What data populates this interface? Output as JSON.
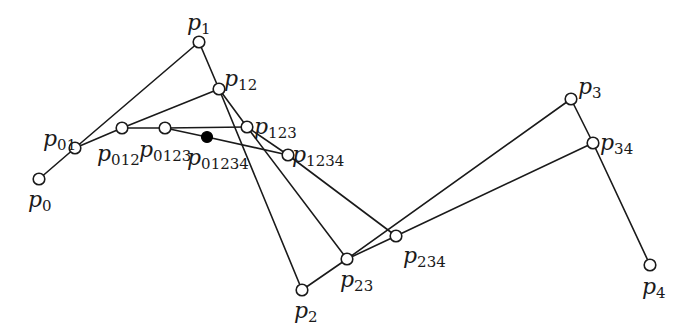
{
  "diagram": {
    "colors": {
      "line": "#1a1a1a",
      "open_point_fill": "#ffffff",
      "result_point_fill": "#000000",
      "background": "#ffffff"
    },
    "points": [
      {
        "id": "p0",
        "base": "p",
        "sub": "0",
        "x": 39,
        "y": 179,
        "filled": false,
        "lx": 28,
        "ly": 207
      },
      {
        "id": "p1",
        "base": "p",
        "sub": "1",
        "x": 199,
        "y": 42,
        "filled": false,
        "lx": 187,
        "ly": 30
      },
      {
        "id": "p2",
        "base": "p",
        "sub": "2",
        "x": 302,
        "y": 290,
        "filled": false,
        "lx": 294,
        "ly": 318
      },
      {
        "id": "p3",
        "base": "p",
        "sub": "3",
        "x": 571,
        "y": 99,
        "filled": false,
        "lx": 578,
        "ly": 94
      },
      {
        "id": "p4",
        "base": "p",
        "sub": "4",
        "x": 650,
        "y": 265,
        "filled": false,
        "lx": 642,
        "ly": 294
      },
      {
        "id": "p01",
        "base": "p",
        "sub": "01",
        "x": 75,
        "y": 148,
        "filled": false,
        "lx": 43,
        "ly": 146
      },
      {
        "id": "p12",
        "base": "p",
        "sub": "12",
        "x": 219,
        "y": 89,
        "filled": false,
        "lx": 224,
        "ly": 86
      },
      {
        "id": "p23",
        "base": "p",
        "sub": "23",
        "x": 347,
        "y": 259,
        "filled": false,
        "lx": 340,
        "ly": 287
      },
      {
        "id": "p34",
        "base": "p",
        "sub": "34",
        "x": 593,
        "y": 143,
        "filled": false,
        "lx": 600,
        "ly": 150
      },
      {
        "id": "p012",
        "base": "p",
        "sub": "012",
        "x": 122,
        "y": 128,
        "filled": false,
        "lx": 97,
        "ly": 161
      },
      {
        "id": "p123",
        "base": "p",
        "sub": "123",
        "x": 247,
        "y": 127,
        "filled": false,
        "lx": 254,
        "ly": 134
      },
      {
        "id": "p234",
        "base": "p",
        "sub": "234",
        "x": 396,
        "y": 236,
        "filled": false,
        "lx": 403,
        "ly": 263
      },
      {
        "id": "p0123",
        "base": "p",
        "sub": "0123",
        "x": 165,
        "y": 128,
        "filled": false,
        "lx": 139,
        "ly": 157
      },
      {
        "id": "p1234",
        "base": "p",
        "sub": "1234",
        "x": 288,
        "y": 155,
        "filled": false,
        "lx": 292,
        "ly": 162
      },
      {
        "id": "p01234",
        "base": "p",
        "sub": "01234",
        "x": 207,
        "y": 137,
        "filled": true,
        "lx": 187,
        "ly": 165
      }
    ],
    "edges": [
      [
        "p0",
        "p01"
      ],
      [
        "p01",
        "p1"
      ],
      [
        "p1",
        "p12"
      ],
      [
        "p12",
        "p2"
      ],
      [
        "p2",
        "p23"
      ],
      [
        "p23",
        "p3"
      ],
      [
        "p3",
        "p34"
      ],
      [
        "p34",
        "p4"
      ],
      [
        "p01",
        "p012"
      ],
      [
        "p012",
        "p12"
      ],
      [
        "p12",
        "p123"
      ],
      [
        "p123",
        "p23"
      ],
      [
        "p23",
        "p234"
      ],
      [
        "p234",
        "p34"
      ],
      [
        "p012",
        "p0123"
      ],
      [
        "p0123",
        "p123"
      ],
      [
        "p123",
        "p1234"
      ],
      [
        "p1234",
        "p234"
      ],
      [
        "p0123",
        "p01234"
      ],
      [
        "p01234",
        "p1234"
      ]
    ]
  }
}
